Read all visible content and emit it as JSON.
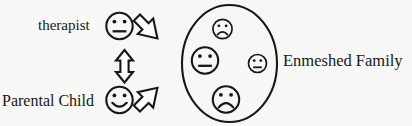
{
  "diagram": {
    "background_color": "#f7f7f5",
    "line_color": "#17171a",
    "labels": {
      "therapist": "therapist",
      "parental_child": "Parental Child",
      "enmeshed_family": "Enmeshed Family"
    },
    "actors": [
      {
        "id": "therapist-face",
        "expression": "neutral",
        "size": "medium"
      },
      {
        "id": "parental-child-face",
        "expression": "smiling",
        "size": "medium"
      }
    ],
    "connectors": [
      {
        "id": "arrow-therapist-to-family",
        "direction": "down-right",
        "heads": 1
      },
      {
        "id": "arrow-vertical-double",
        "direction": "vertical",
        "heads": 2
      },
      {
        "id": "arrow-parental-child-to-family",
        "direction": "up-right",
        "heads": 1
      }
    ],
    "family_group": {
      "shape": "ellipse",
      "members": [
        {
          "id": "family-member-top",
          "expression": "sad",
          "size": "small",
          "position": "top"
        },
        {
          "id": "family-member-left",
          "expression": "neutral",
          "size": "medium",
          "position": "left"
        },
        {
          "id": "family-member-right",
          "expression": "neutral",
          "size": "small",
          "position": "right"
        },
        {
          "id": "family-member-bottom",
          "expression": "sad",
          "size": "medium",
          "position": "bottom"
        }
      ]
    }
  }
}
